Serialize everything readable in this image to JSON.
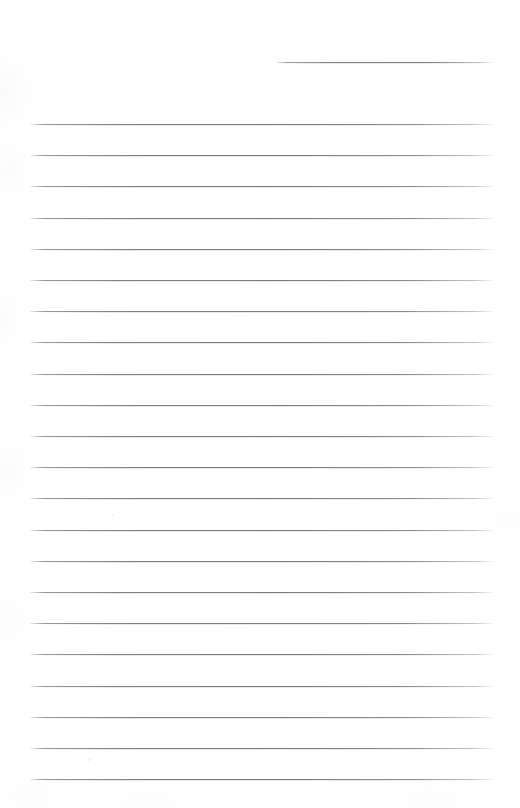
{
  "document": {
    "kind": "blank-ruled-paper-scan",
    "title": "Blank Ruled Notebook Page",
    "page_width": 520,
    "page_height": 808,
    "background_color": "#ffffff",
    "rule_color": "#808084",
    "rule_thickness_px": 1,
    "rule_spacing_px": 31.2,
    "content_text": "",
    "header_rule": {
      "label": "header-rule",
      "x": 277,
      "y": 62,
      "width": 215
    },
    "body_rules": {
      "label": "body-rules",
      "count": 22,
      "x": 30,
      "width": 463,
      "y_positions": [
        124.0,
        155.2,
        186.4,
        217.6,
        248.8,
        280.0,
        311.2,
        342.4,
        373.6,
        404.8,
        436.0,
        467.2,
        498.4,
        529.6,
        560.8,
        592.0,
        623.2,
        654.4,
        685.6,
        716.8,
        748.0,
        779.2
      ]
    },
    "artifacts": [
      {
        "label": "scan-speck",
        "x": 88,
        "y": 758,
        "size": 3
      },
      {
        "label": "scan-speck",
        "x": 112,
        "y": 514,
        "size": 2
      }
    ]
  }
}
